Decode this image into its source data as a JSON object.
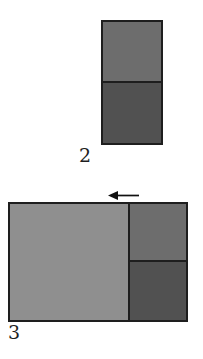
{
  "page": {
    "background": "#ffffff"
  },
  "colors": {
    "outline": "#1e1e1e",
    "light_gray": "#8f8f8f",
    "medium_gray": "#6d6d6d",
    "dark_gray": "#515151",
    "arrow": "#111111",
    "label_text": "#1f1f1f"
  },
  "figure2": {
    "label": "2",
    "top_square_color": "#6d6d6d",
    "bottom_square_color": "#515151"
  },
  "figure3": {
    "label": "3",
    "arrow_icon": "left-arrow-icon",
    "large_square_color": "#8f8f8f",
    "right_top_square_color": "#6d6d6d",
    "right_bottom_square_color": "#515151"
  }
}
